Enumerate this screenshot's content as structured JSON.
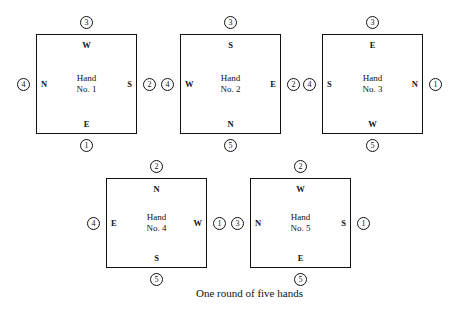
{
  "figure": {
    "caption": "One round of five hands",
    "caption_x": 196,
    "caption_y": 287,
    "ink_color": "#111111",
    "background_color": "#ffffff"
  },
  "hands": [
    {
      "id": "hand-1",
      "title_line1": "Hand",
      "title_line2": "No. 1",
      "x": 36,
      "y": 34,
      "w": 101,
      "h": 100,
      "compass": {
        "top": "W",
        "bottom": "E",
        "left": "N",
        "right": "S"
      },
      "markers": {
        "top": "3",
        "bottom": "1",
        "left": "4",
        "right": "2"
      }
    },
    {
      "id": "hand-2",
      "title_line1": "Hand",
      "title_line2": "No. 2",
      "x": 180,
      "y": 34,
      "w": 101,
      "h": 100,
      "compass": {
        "top": "S",
        "bottom": "N",
        "left": "W",
        "right": "E"
      },
      "markers": {
        "top": "3",
        "bottom": "5",
        "left": "4",
        "right": "2"
      }
    },
    {
      "id": "hand-3",
      "title_line1": "Hand",
      "title_line2": "No. 3",
      "x": 322,
      "y": 34,
      "w": 101,
      "h": 100,
      "compass": {
        "top": "E",
        "bottom": "W",
        "left": "S",
        "right": "N"
      },
      "markers": {
        "top": "3",
        "bottom": "5",
        "left": "4",
        "right": "1"
      }
    },
    {
      "id": "hand-4",
      "title_line1": "Hand",
      "title_line2": "No. 4",
      "x": 106,
      "y": 178,
      "w": 101,
      "h": 90,
      "compass": {
        "top": "N",
        "bottom": "S",
        "left": "E",
        "right": "W"
      },
      "markers": {
        "top": "2",
        "bottom": "5",
        "left": "4",
        "right": "1"
      }
    },
    {
      "id": "hand-5",
      "title_line1": "Hand",
      "title_line2": "No. 5",
      "x": 250,
      "y": 178,
      "w": 101,
      "h": 90,
      "compass": {
        "top": "W",
        "bottom": "E",
        "left": "N",
        "right": "S"
      },
      "markers": {
        "top": "2",
        "bottom": "5",
        "left": "3",
        "right": "1"
      }
    }
  ]
}
